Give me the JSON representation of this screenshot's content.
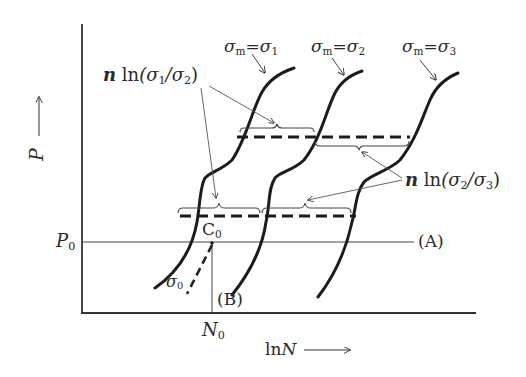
{
  "diagram": {
    "axes": {
      "y_label": "P",
      "y_arrow": "⟶",
      "x_label": "lnN",
      "x_label_ln": "ln",
      "x_label_var": "N",
      "x_arrow": "⟶"
    },
    "reference": {
      "p0_label": "P",
      "p0_sub": "0",
      "n0_label": "N",
      "n0_sub": "0",
      "c0_label": "C",
      "c0_sub": "0",
      "line_a_label": "(A)",
      "line_b_label": "(B)"
    },
    "curves": [
      {
        "id": "sigma1",
        "prefix": "σ",
        "sub": "m",
        "eq": "=",
        "sym": "σ",
        "num": "1"
      },
      {
        "id": "sigma2",
        "prefix": "σ",
        "sub": "m",
        "eq": "=",
        "sym": "σ",
        "num": "2"
      },
      {
        "id": "sigma3",
        "prefix": "σ",
        "sub": "m",
        "eq": "=",
        "sym": "σ",
        "num": "3"
      }
    ],
    "sigma0": {
      "sym": "σ",
      "sub": "0"
    },
    "annotations": {
      "shift12": {
        "n": "n",
        "ln": "ln",
        "open": "(σ",
        "a": "1",
        "mid": "/σ",
        "b": "2",
        "close": ")"
      },
      "shift23": {
        "n": "n",
        "ln": "ln",
        "open": "(σ",
        "a": "2",
        "mid": "/σ",
        "b": "3",
        "close": ")"
      }
    },
    "colors": {
      "ink": "#222222",
      "thin": "#444444",
      "background": "#ffffff"
    }
  }
}
